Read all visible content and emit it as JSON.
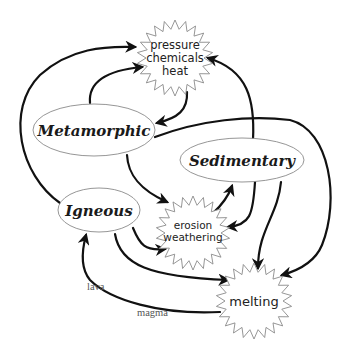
{
  "colors": {
    "arrow": "#111111",
    "shape_outline": "#8a8a8a",
    "rock_text": "#1a1a1a",
    "path_text": "#555555",
    "background": "#ffffff"
  },
  "rocks": {
    "metamorphic": "Metamorphic",
    "sedimentary": "Sedimentary",
    "igneous": "Igneous"
  },
  "processes": {
    "pressure": [
      "pressure",
      "chemicals",
      "heat"
    ],
    "erosion": [
      "erosion",
      "weathering"
    ],
    "melting": [
      "melting"
    ]
  },
  "path_labels": {
    "lava": "lava",
    "magma": "magma"
  },
  "connections": [
    {
      "from": "igneous",
      "to": "pressure"
    },
    {
      "from": "metamorphic",
      "to": "pressure"
    },
    {
      "from": "pressure",
      "to": "metamorphic"
    },
    {
      "from": "sedimentary",
      "to": "pressure"
    },
    {
      "from": "metamorphic",
      "to": "erosion"
    },
    {
      "from": "metamorphic",
      "to": "melting"
    },
    {
      "from": "erosion",
      "to": "sedimentary"
    },
    {
      "from": "sedimentary",
      "to": "erosion"
    },
    {
      "from": "sedimentary",
      "to": "melting"
    },
    {
      "from": "igneous",
      "to": "erosion"
    },
    {
      "from": "igneous",
      "to": "melting"
    },
    {
      "from": "melting",
      "to": "igneous",
      "labels": [
        "lava",
        "magma"
      ]
    }
  ]
}
